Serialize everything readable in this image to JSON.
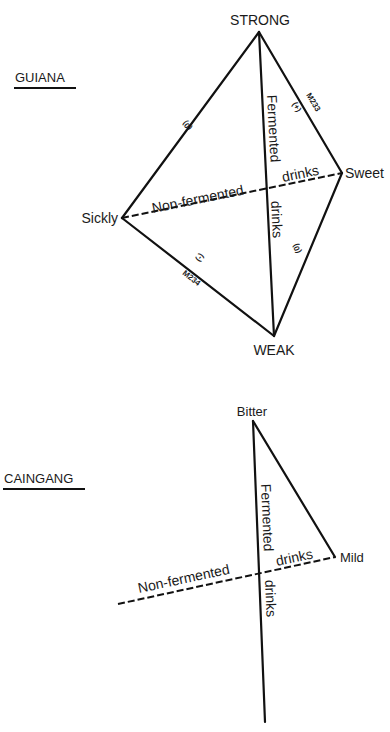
{
  "diagrams": [
    {
      "title": "GUIANA",
      "vertices": {
        "top": "STRONG",
        "left": "Sickly",
        "right": "Sweet",
        "bottom": "WEAK"
      },
      "axes": {
        "vertical_upper": "Fermented",
        "vertical_lower": "drinks",
        "horizontal_left": "Non-fermented",
        "horizontal_right": "drinks"
      },
      "edge_labels": {
        "strong_sweet_myth": "M233",
        "strong_sweet_sign": "(+)",
        "strong_sickly_sign": "(0)",
        "sweet_weak_sign": "(0)",
        "sickly_weak_sign": "(-)",
        "sickly_weak_myth": "M234"
      }
    },
    {
      "title": "CAINGANG",
      "vertices": {
        "top": "Bitter",
        "right": "Mild"
      },
      "axes": {
        "vertical_upper": "Fermented",
        "vertical_lower": "drinks",
        "horizontal_left": "Non-fermented",
        "horizontal_right": "drinks"
      }
    }
  ]
}
